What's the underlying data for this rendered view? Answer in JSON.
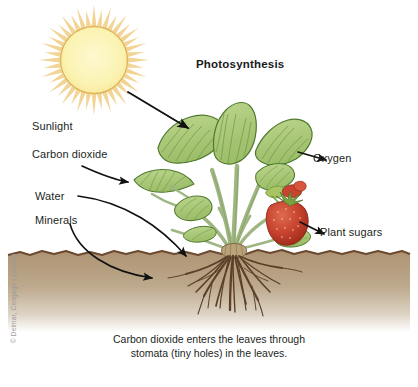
{
  "figure": {
    "title": "Photosynthesis",
    "credit": "© Delmar, Cengage Learning",
    "caption_line1": "Carbon dioxide enters the leaves through",
    "caption_line2": "stomata (tiny holes) in the leaves."
  },
  "labels": {
    "sunlight": "Sunlight",
    "carbon_dioxide": "Carbon dioxide",
    "water": "Water",
    "minerals": "Minerals",
    "oxygen": "Oxygen",
    "plant_sugars": "Plant sugars"
  },
  "colors": {
    "sun_disc": "#fbf3b2",
    "sun_outline": "#e0b356",
    "sun_rays": "#f0cf88",
    "leaf_fill": "#aecb7d",
    "leaf_vein": "#6f9442",
    "leaf_outline": "#4f7a2e",
    "stem": "#9fb682",
    "fruit": "#c9432f",
    "fruit_dark": "#a32d1d",
    "calyx": "#79a33c",
    "soil": "#b29a7a",
    "soil_edge": "#6b4a2f",
    "root": "#5b4029",
    "arrow": "#111111",
    "text": "#231f1c",
    "credit_text": "#9a9a9a",
    "background": "#ffffff"
  },
  "elements": {
    "sun_name": "sun",
    "plant_name": "strawberry-plant",
    "soil_name": "soil-layer",
    "roots_name": "root-system",
    "fruit_name": "strawberry-fruit"
  }
}
